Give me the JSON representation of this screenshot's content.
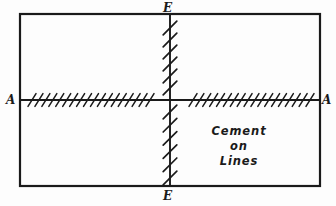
{
  "figure": {
    "background_color": "#fdfdfd",
    "ink_color": "#1a1a1a",
    "labels": {
      "vertical_axis_top": "E",
      "vertical_axis_bottom": "E",
      "horizontal_axis_left": "A",
      "horizontal_axis_right": "A"
    },
    "annotation": {
      "line1": "Cement",
      "line2": "on",
      "line3": "Lines"
    }
  },
  "chart_data": {
    "type": "diagram",
    "title": "Cement on Lines",
    "border_rect": {
      "x": 20,
      "y": 14,
      "width": 300,
      "height": 172
    },
    "axes": [
      {
        "name": "A-A",
        "orientation": "horizontal",
        "y": 100,
        "x_start": 20,
        "x_end": 320,
        "end_labels": [
          "A",
          "A"
        ]
      },
      {
        "name": "E-E",
        "orientation": "vertical",
        "x": 170,
        "y_start": 14,
        "y_end": 186,
        "end_labels": [
          "E",
          "E"
        ]
      }
    ],
    "hatch_runs": [
      {
        "name": "left-horizontal-hatching",
        "along": "A-A",
        "axis": "horizontal",
        "start": 32,
        "end": 150,
        "count": 18,
        "lean": "right",
        "stroke_length": 16
      },
      {
        "name": "right-horizontal-hatching",
        "along": "A-A",
        "axis": "horizontal",
        "start": 193,
        "end": 310,
        "count": 18,
        "lean": "right",
        "stroke_length": 16
      },
      {
        "name": "upper-vertical-hatching",
        "along": "E-E",
        "axis": "vertical",
        "start": 28,
        "end": 88,
        "count": 6,
        "lean": "right",
        "stroke_length": 22
      },
      {
        "name": "lower-vertical-hatching",
        "along": "E-E",
        "axis": "vertical",
        "start": 112,
        "end": 178,
        "count": 6,
        "lean": "right",
        "stroke_length": 22
      }
    ],
    "annotations": [
      {
        "text": "Cement",
        "x": 239,
        "y": 131
      },
      {
        "text": "on",
        "x": 239,
        "y": 146
      },
      {
        "text": "Lines",
        "x": 239,
        "y": 161
      }
    ]
  }
}
